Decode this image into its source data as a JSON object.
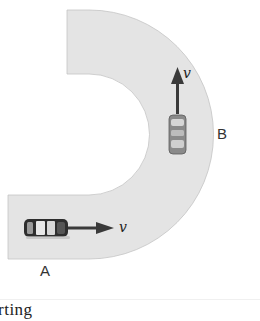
{
  "diagram": {
    "road_color": "#e4e4e4",
    "road_edge_color": "#bdbdbd",
    "arrow_color": "#3a3a3a",
    "points": [
      {
        "id": "A",
        "label": "A"
      },
      {
        "id": "B",
        "label": "B"
      }
    ],
    "velocity_symbol": "v",
    "cars": [
      {
        "id": "car-a",
        "position": "A",
        "direction": "right",
        "velocity_label": "v"
      },
      {
        "id": "car-b",
        "position": "B",
        "direction": "up",
        "velocity_label": "v"
      }
    ]
  },
  "caption": "rting"
}
